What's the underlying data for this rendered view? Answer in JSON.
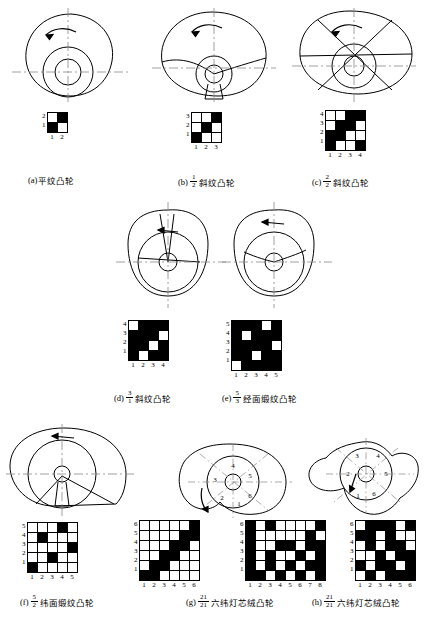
{
  "page": {
    "background": "#ffffff",
    "ink": "#000000"
  },
  "figures": [
    {
      "id": "a",
      "label": "(a)",
      "caption_text": "平纹凸轮",
      "fraction": null,
      "cam": {
        "type": "plain-weave-cam",
        "lobes": 1,
        "rotation_arrow": "counter-clockwise",
        "sector_numbers": []
      },
      "draft": {
        "rows": 2,
        "cols": 2,
        "row_labels": [
          "2",
          "1"
        ],
        "col_labels": [
          "1",
          "2"
        ],
        "matrix": [
          [
            0,
            1
          ],
          [
            1,
            0
          ]
        ]
      }
    },
    {
      "id": "b",
      "label": "(b)",
      "caption_text": "斜纹凸轮",
      "fraction": {
        "num": "1",
        "den": "2"
      },
      "cam": {
        "type": "twill-cam",
        "lobes": 3,
        "rotation_arrow": "counter-clockwise",
        "sector_numbers": []
      },
      "draft": {
        "rows": 3,
        "cols": 3,
        "row_labels": [
          "3",
          "2",
          "1"
        ],
        "col_labels": [
          "1",
          "2",
          "3"
        ],
        "matrix": [
          [
            0,
            0,
            1
          ],
          [
            0,
            1,
            0
          ],
          [
            1,
            0,
            0
          ]
        ]
      }
    },
    {
      "id": "c",
      "label": "(c)",
      "caption_text": "斜纹凸轮",
      "fraction": {
        "num": "2",
        "den": "2"
      },
      "cam": {
        "type": "twill-cam",
        "lobes": 4,
        "rotation_arrow": "counter-clockwise",
        "sector_numbers": []
      },
      "draft": {
        "rows": 4,
        "cols": 4,
        "row_labels": [
          "4",
          "3",
          "2",
          "1"
        ],
        "col_labels": [
          "1",
          "2",
          "3",
          "4"
        ],
        "matrix": [
          [
            0,
            0,
            1,
            1
          ],
          [
            0,
            1,
            1,
            0
          ],
          [
            1,
            1,
            0,
            0
          ],
          [
            1,
            0,
            0,
            1
          ]
        ]
      }
    },
    {
      "id": "d",
      "label": "(d)",
      "caption_text": "斜纹凸轮",
      "fraction": {
        "num": "3",
        "den": "1"
      },
      "cam": {
        "type": "twill-cam",
        "lobes": 3,
        "rotation_arrow": "counter-clockwise",
        "sector_numbers": []
      },
      "draft": {
        "rows": 4,
        "cols": 4,
        "row_labels": [
          "4",
          "3",
          "2",
          "1"
        ],
        "col_labels": [
          "1",
          "2",
          "3",
          "4"
        ],
        "matrix": [
          [
            0,
            1,
            1,
            1
          ],
          [
            1,
            1,
            1,
            0
          ],
          [
            1,
            1,
            0,
            1
          ],
          [
            1,
            0,
            1,
            1
          ]
        ]
      }
    },
    {
      "id": "e",
      "label": "(e)",
      "caption_text": "经面缎纹凸轮",
      "fraction": {
        "num": "5",
        "den": "3"
      },
      "cam": {
        "type": "satin-cam",
        "lobes": 3,
        "rotation_arrow": "counter-clockwise",
        "sector_numbers": []
      },
      "draft": {
        "rows": 5,
        "cols": 5,
        "row_labels": [
          "5",
          "4",
          "3",
          "2",
          "1"
        ],
        "col_labels": [
          "1",
          "2",
          "3",
          "4",
          "5"
        ],
        "matrix": [
          [
            1,
            1,
            1,
            0,
            1
          ],
          [
            1,
            0,
            1,
            1,
            1
          ],
          [
            1,
            1,
            1,
            1,
            0
          ],
          [
            1,
            1,
            0,
            1,
            1
          ],
          [
            0,
            1,
            1,
            1,
            1
          ]
        ]
      }
    },
    {
      "id": "f",
      "label": "(f)",
      "caption_text": "纬面缎纹凸轮",
      "fraction": {
        "num": "5",
        "den": "2"
      },
      "cam": {
        "type": "weft-satin-cam",
        "lobes": 1,
        "rotation_arrow": "counter-clockwise",
        "sector_numbers": []
      },
      "draft": {
        "rows": 5,
        "cols": 5,
        "row_labels": [
          "5",
          "4",
          "3",
          "2",
          "1"
        ],
        "col_labels": [
          "1",
          "2",
          "3",
          "4",
          "5"
        ],
        "matrix": [
          [
            0,
            0,
            0,
            1,
            0
          ],
          [
            0,
            1,
            0,
            0,
            0
          ],
          [
            0,
            0,
            0,
            0,
            1
          ],
          [
            0,
            0,
            1,
            0,
            0
          ],
          [
            1,
            0,
            0,
            0,
            0
          ]
        ]
      }
    },
    {
      "id": "g",
      "label": "(g)",
      "caption_text": "六纬灯芯绒凸轮",
      "fraction": {
        "num": "21",
        "den": "21"
      },
      "cam": {
        "type": "corduroy-cam",
        "lobes": 1,
        "rotation_arrow": "counter-clockwise",
        "sector_numbers": [
          "1",
          "2",
          "3",
          "4",
          "5",
          "6"
        ]
      },
      "draft": {
        "rows": 6,
        "cols": 6,
        "row_labels": [
          "6",
          "5",
          "4",
          "3",
          "2",
          "1"
        ],
        "col_labels": [
          "1",
          "2",
          "3",
          "4",
          "5",
          "6"
        ],
        "matrix": [
          [
            0,
            0,
            0,
            0,
            0,
            1
          ],
          [
            0,
            0,
            0,
            0,
            1,
            1
          ],
          [
            0,
            0,
            0,
            1,
            1,
            0
          ],
          [
            0,
            0,
            1,
            1,
            0,
            0
          ],
          [
            0,
            1,
            1,
            0,
            0,
            0
          ],
          [
            1,
            1,
            0,
            0,
            0,
            0
          ]
        ]
      },
      "draft2": {
        "rows": 6,
        "cols": 8,
        "row_labels": [
          "6",
          "5",
          "4",
          "3",
          "2",
          "1"
        ],
        "col_labels": [
          "1",
          "2",
          "3",
          "4",
          "5",
          "6",
          "7",
          "8"
        ],
        "matrix": [
          [
            1,
            0,
            1,
            0,
            0,
            0,
            0,
            1
          ],
          [
            1,
            0,
            0,
            0,
            0,
            0,
            1,
            0
          ],
          [
            1,
            0,
            0,
            1,
            1,
            0,
            1,
            1
          ],
          [
            1,
            0,
            1,
            0,
            0,
            1,
            0,
            1
          ],
          [
            1,
            0,
            1,
            0,
            1,
            0,
            1,
            1
          ],
          [
            1,
            1,
            0,
            1,
            0,
            1,
            0,
            1
          ]
        ]
      }
    },
    {
      "id": "h",
      "label": "(h)",
      "caption_text": "六纬灯芯绒凸轮",
      "fraction": {
        "num": "21",
        "den": "21"
      },
      "cam": {
        "type": "corduroy-cam",
        "lobes": 2,
        "rotation_arrow": "counter-clockwise",
        "sector_numbers": [
          "1",
          "2",
          "3",
          "4",
          "5",
          "6"
        ]
      },
      "draft": {
        "rows": 6,
        "cols": 6,
        "row_labels": [
          "6",
          "5",
          "4",
          "3",
          "2",
          "1"
        ],
        "col_labels": [
          "1",
          "2",
          "3",
          "4",
          "5",
          "6"
        ],
        "matrix": [
          [
            0,
            1,
            1,
            1,
            0,
            1
          ],
          [
            1,
            1,
            0,
            1,
            0,
            0
          ],
          [
            0,
            1,
            0,
            1,
            1,
            0
          ],
          [
            0,
            0,
            1,
            0,
            1,
            1
          ],
          [
            1,
            0,
            1,
            1,
            0,
            1
          ],
          [
            0,
            1,
            0,
            1,
            1,
            1
          ]
        ]
      }
    }
  ]
}
